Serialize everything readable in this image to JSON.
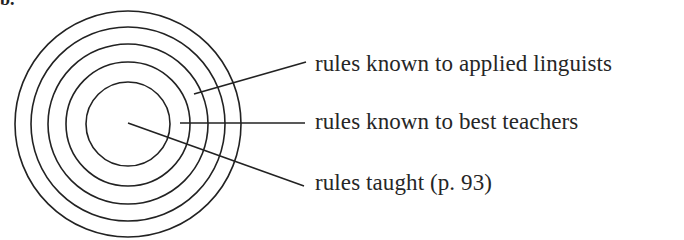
{
  "diagram": {
    "type": "concentric-circles",
    "corner_fragment": "b.",
    "center": [
      128,
      124
    ],
    "radii": [
      113,
      97,
      80,
      62,
      42
    ],
    "stroke_color": "#222222",
    "text_color": "#262626",
    "labels": [
      {
        "text": "rules known to applied linguists",
        "leader_from": [
          194,
          94
        ],
        "leader_to": [
          306,
          62
        ]
      },
      {
        "text": "rules known to best teachers",
        "leader_from": [
          180,
          123
        ],
        "leader_to": [
          305,
          123
        ]
      },
      {
        "text": "rules taught (p. 93)",
        "leader_from": [
          128,
          123
        ],
        "leader_to": [
          304,
          186
        ]
      }
    ]
  }
}
